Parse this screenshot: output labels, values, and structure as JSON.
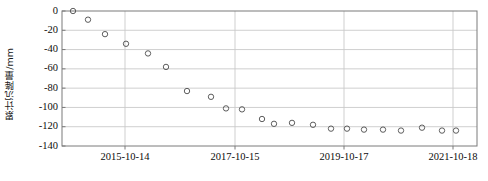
{
  "chart_data": {
    "type": "scatter",
    "title": "",
    "xlabel": "",
    "ylabel": "累计沉降量/mm",
    "ylim": [
      -140,
      0
    ],
    "yticks": [
      0,
      -20,
      -40,
      -60,
      -80,
      -100,
      -120,
      -140
    ],
    "ytick_labels": [
      "0",
      "-20",
      "-40",
      "-60",
      "-80",
      "-100",
      "-120",
      "-140"
    ],
    "xtick_labels": [
      "2015-10-14",
      "2017-10-15",
      "2019-10-17",
      "2021-10-18"
    ],
    "xtick_positions_px": [
      125,
      235,
      344,
      453
    ],
    "grid": true,
    "legend": false,
    "marker": "open-circle",
    "marker_color": "#555555",
    "points": [
      {
        "x_px": 73,
        "y": 0
      },
      {
        "x_px": 88,
        "y": -9
      },
      {
        "x_px": 105,
        "y": -24
      },
      {
        "x_px": 126,
        "y": -34
      },
      {
        "x_px": 148,
        "y": -44
      },
      {
        "x_px": 166,
        "y": -58
      },
      {
        "x_px": 187,
        "y": -83
      },
      {
        "x_px": 211,
        "y": -89
      },
      {
        "x_px": 226,
        "y": -101
      },
      {
        "x_px": 242,
        "y": -102
      },
      {
        "x_px": 262,
        "y": -112
      },
      {
        "x_px": 274,
        "y": -117
      },
      {
        "x_px": 292,
        "y": -116
      },
      {
        "x_px": 313,
        "y": -118
      },
      {
        "x_px": 331,
        "y": -122
      },
      {
        "x_px": 347,
        "y": -122
      },
      {
        "x_px": 364,
        "y": -123
      },
      {
        "x_px": 383,
        "y": -123
      },
      {
        "x_px": 401,
        "y": -124
      },
      {
        "x_px": 422,
        "y": -121
      },
      {
        "x_px": 442,
        "y": -124
      },
      {
        "x_px": 456,
        "y": -124
      }
    ]
  },
  "axes": {
    "left_px": 62,
    "right_px": 477,
    "top_px": 11,
    "bottom_px": 146,
    "frame_color": "#7a7a7a",
    "grid_color": "#c9c9c9"
  }
}
